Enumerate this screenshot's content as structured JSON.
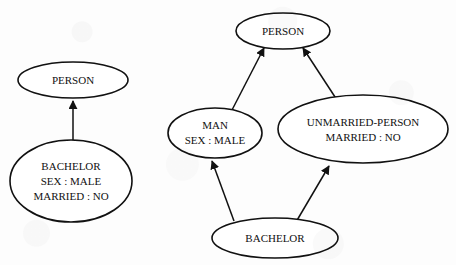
{
  "figure": {
    "type": "semantic-network-diagram",
    "background_color": "#fdfdfd",
    "ink_color": "#111111",
    "panels": [
      {
        "id": "left",
        "name": "single-inheritance-network",
        "nodes": [
          {
            "id": "left-person",
            "name": "person-node",
            "lines": [
              "PERSON"
            ],
            "cx": 73,
            "cy": 80,
            "rx": 55,
            "ry": 18,
            "font_size": 11
          },
          {
            "id": "left-bachelor",
            "name": "bachelor-node",
            "lines": [
              "BACHELOR",
              "SEX : MALE",
              "MARRIED : NO"
            ],
            "cx": 71,
            "cy": 181,
            "rx": 61,
            "ry": 41,
            "font_size": 11
          }
        ],
        "edges": [
          {
            "id": "left-bachelor-to-person",
            "name": "isa-edge-bachelor-person",
            "from": "left-bachelor",
            "to": "left-person",
            "x1": 73,
            "y1": 140,
            "x2": 73,
            "y2": 99,
            "arrow": "to"
          }
        ]
      },
      {
        "id": "right",
        "name": "multiple-inheritance-network",
        "nodes": [
          {
            "id": "top-person",
            "name": "person-node",
            "lines": [
              "PERSON"
            ],
            "cx": 283,
            "cy": 31,
            "rx": 47,
            "ry": 18,
            "font_size": 11
          },
          {
            "id": "man",
            "name": "man-node",
            "lines": [
              "MAN",
              "SEX : MALE"
            ],
            "cx": 215,
            "cy": 133,
            "rx": 47,
            "ry": 25,
            "font_size": 11
          },
          {
            "id": "unmarried-person",
            "name": "unmarried-person-node",
            "lines": [
              "UNMARRIED-PERSON",
              "MARRIED : NO"
            ],
            "cx": 363,
            "cy": 129,
            "rx": 85,
            "ry": 34,
            "font_size": 11
          },
          {
            "id": "right-bachelor",
            "name": "bachelor-node",
            "lines": [
              "BACHELOR"
            ],
            "cx": 275,
            "cy": 238,
            "rx": 63,
            "ry": 20,
            "font_size": 11
          }
        ],
        "edges": [
          {
            "id": "man-to-person",
            "name": "isa-edge-man-person",
            "from": "man",
            "to": "top-person",
            "x1": 232,
            "y1": 110,
            "x2": 263,
            "y2": 46,
            "arrow": "to"
          },
          {
            "id": "unmarried-to-person",
            "name": "isa-edge-unmarried-person-person",
            "from": "unmarried-person",
            "to": "top-person",
            "x1": 336,
            "y1": 99,
            "x2": 303,
            "y2": 46,
            "arrow": "to"
          },
          {
            "id": "bachelor-to-man",
            "name": "isa-edge-bachelor-man",
            "from": "right-bachelor",
            "to": "man",
            "x1": 234,
            "y1": 221,
            "x2": 211,
            "y2": 159,
            "arrow": "to"
          },
          {
            "id": "bachelor-to-unmarried",
            "name": "isa-edge-bachelor-unmarried-person",
            "from": "right-bachelor",
            "to": "unmarried-person",
            "x1": 296,
            "y1": 222,
            "x2": 330,
            "y2": 164,
            "arrow": "to"
          }
        ]
      }
    ]
  }
}
